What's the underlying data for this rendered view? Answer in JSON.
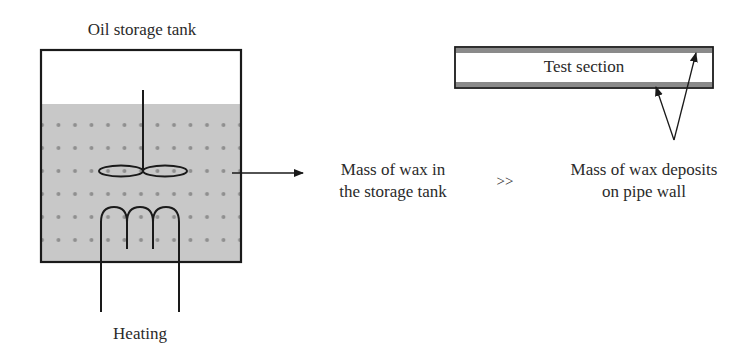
{
  "diagram": {
    "tank": {
      "title": "Oil storage tank",
      "heating_label": "Heating"
    },
    "pipe": {
      "label": "Test section"
    },
    "comparison": {
      "left_text_line1": "Mass of wax in",
      "left_text_line2": "the storage tank",
      "operator": ">>",
      "right_text_line1": "Mass of wax deposits",
      "right_text_line2": "on pipe wall"
    },
    "colors": {
      "liquid_fill": "#c8c8c8",
      "particle_dots": "#8f8f8f",
      "lines": "#1a1a1a",
      "wax_layer": "#8a8a8a"
    }
  }
}
